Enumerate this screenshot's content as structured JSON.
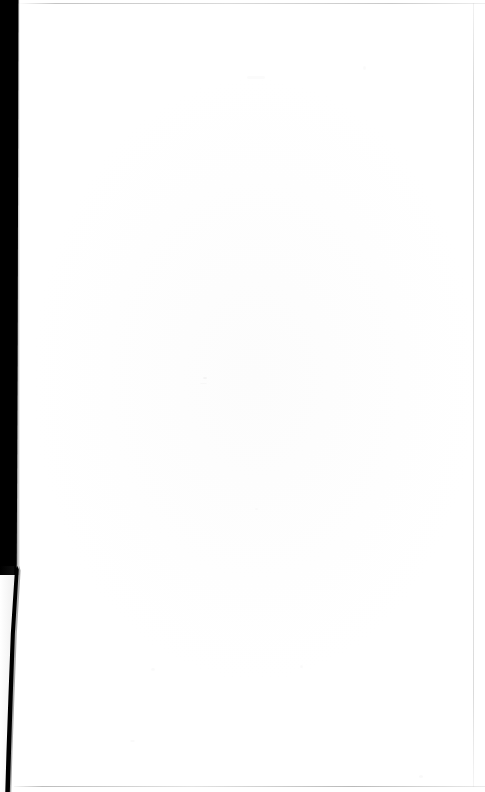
{
  "document": {
    "kind": "scanned-page",
    "page_content_text": "",
    "is_blank": "true",
    "background_color": "#ffffff",
    "gutter_color": "#000000",
    "edge_rule_color": "#b4b4b4",
    "speck_color": "#9a9a9a",
    "page_width_px": "485",
    "page_height_px": "792"
  },
  "regions": {
    "paper_label": "",
    "gutter_label": "",
    "binding_label": "",
    "top_edge_label": "",
    "bottom_edge_label": "",
    "right_edge_label": ""
  },
  "chart_data": null
}
